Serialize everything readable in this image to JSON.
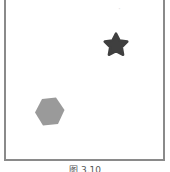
{
  "figure": {
    "caption": "图 3.10",
    "shapes": [
      {
        "type": "star",
        "color": "#3f3f3f",
        "cx": 116,
        "cy": 45
      },
      {
        "type": "hexagon",
        "color": "#9a9a9a",
        "cx": 49,
        "cy": 111
      }
    ],
    "frame_color": "#8a8a8a",
    "faint_mark": "·"
  }
}
